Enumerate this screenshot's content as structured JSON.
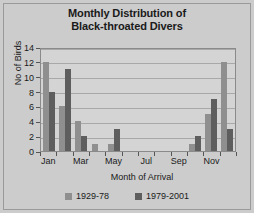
{
  "chart_data": {
    "type": "bar",
    "title": "Monthly Distribution of Black-throated Divers",
    "title_lines": [
      "Monthly Distribution of",
      "Black-throated Divers"
    ],
    "xlabel": "Month of Arrival",
    "ylabel": "No of Birds",
    "ylim": [
      0,
      14
    ],
    "yticks": [
      0,
      2,
      4,
      6,
      8,
      10,
      12,
      14
    ],
    "grid": true,
    "legend_position": "bottom",
    "categories": [
      "Jan",
      "Feb",
      "Mar",
      "Apr",
      "May",
      "Jun",
      "Jul",
      "Aug",
      "Sep",
      "Oct",
      "Nov",
      "Dec"
    ],
    "tick_labels": [
      "Jan",
      "Mar",
      "May",
      "Jul",
      "Sep",
      "Nov"
    ],
    "series": [
      {
        "name": "1929-78",
        "color": "#8f8f8f",
        "values": [
          12,
          6,
          4,
          1,
          1,
          0,
          0,
          0,
          0,
          1,
          5,
          12
        ]
      },
      {
        "name": "1979-2001",
        "color": "#5e5e5e",
        "values": [
          8,
          11,
          2,
          0,
          3,
          0,
          0,
          0,
          0,
          2,
          7,
          3
        ]
      }
    ]
  },
  "legend": {
    "entries": [
      {
        "label": "1929-78"
      },
      {
        "label": "1979-2001"
      }
    ]
  }
}
